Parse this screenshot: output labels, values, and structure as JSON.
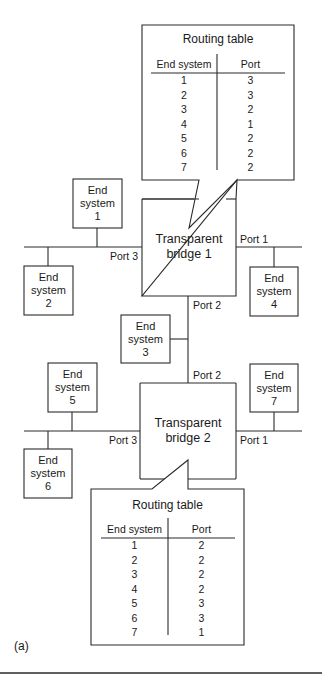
{
  "figure": {
    "label": "(a)"
  },
  "bridges": [
    {
      "id": "bridge-1",
      "line1": "Transparent",
      "line2": "bridge 1",
      "ports": {
        "p1": "Port 1",
        "p2": "Port 2",
        "p3": "Port 3"
      }
    },
    {
      "id": "bridge-2",
      "line1": "Transparent",
      "line2": "bridge 2",
      "ports": {
        "p1": "Port 1",
        "p2": "Port 2",
        "p3": "Port 3"
      }
    }
  ],
  "end_systems": [
    {
      "line1": "End",
      "line2": "system",
      "num": "1"
    },
    {
      "line1": "End",
      "line2": "system",
      "num": "2"
    },
    {
      "line1": "End",
      "line2": "system",
      "num": "3"
    },
    {
      "line1": "End",
      "line2": "system",
      "num": "4"
    },
    {
      "line1": "End",
      "line2": "system",
      "num": "5"
    },
    {
      "line1": "End",
      "line2": "system",
      "num": "6"
    },
    {
      "line1": "End",
      "line2": "system",
      "num": "7"
    }
  ],
  "routing_tables": [
    {
      "bridge": "bridge-1",
      "title": "Routing table",
      "columns": [
        "End system",
        "Port"
      ],
      "rows": [
        [
          "1",
          "3"
        ],
        [
          "2",
          "3"
        ],
        [
          "3",
          "2"
        ],
        [
          "4",
          "1"
        ],
        [
          "5",
          "2"
        ],
        [
          "6",
          "2"
        ],
        [
          "7",
          "2"
        ]
      ]
    },
    {
      "bridge": "bridge-2",
      "title": "Routing table",
      "columns": [
        "End system",
        "Port"
      ],
      "rows": [
        [
          "1",
          "2"
        ],
        [
          "2",
          "2"
        ],
        [
          "3",
          "2"
        ],
        [
          "4",
          "2"
        ],
        [
          "5",
          "3"
        ],
        [
          "6",
          "3"
        ],
        [
          "7",
          "1"
        ]
      ]
    }
  ],
  "colors": {
    "stroke": "#2a2a2a",
    "background": "#ffffff"
  }
}
